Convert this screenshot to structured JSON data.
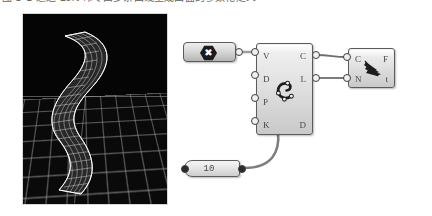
{
  "page": {
    "background_color": "#ffffff",
    "width": 432,
    "height": 216
  },
  "caption": {
    "text": "图 3-1 通过 Loft 命令由多条曲线生成曲面的参数化定义",
    "note": "clipped-top-caption"
  },
  "viewport": {
    "name": "rhino-3d-viewport",
    "background_color": "#000000",
    "grid_color": "#969696",
    "geometry_label": "lofted-surface-mesh",
    "geometry_color": "#ffffff"
  },
  "canvas": {
    "name": "grasshopper-canvas",
    "background_color": "#ffffff",
    "wire_color": "#6b6b6b"
  },
  "nodes": {
    "param": {
      "name": "curve-parameter-component",
      "icon": "hexagon-x-icon",
      "icon_glyph": "✖",
      "icon_color": "#1b1b1b"
    },
    "main": {
      "name": "interpolate-curve-component",
      "icon": "curve-interpolate-icon",
      "inputs": [
        "V",
        "D",
        "P",
        "K"
      ],
      "outputs": [
        "C",
        "L",
        "D"
      ]
    },
    "right": {
      "name": "loft-component",
      "icon": "loft-surface-icon",
      "inputs": [
        "C",
        "N"
      ],
      "outputs": [
        "F",
        "t"
      ]
    },
    "slider": {
      "name": "number-slider-component",
      "value": "10"
    }
  },
  "wires": [
    {
      "from": "param.output",
      "to": "main.V"
    },
    {
      "from": "main.C",
      "to": "right.C"
    },
    {
      "from": "main.L",
      "to": "right.N"
    },
    {
      "from": "slider.output",
      "to": "main.K"
    }
  ]
}
